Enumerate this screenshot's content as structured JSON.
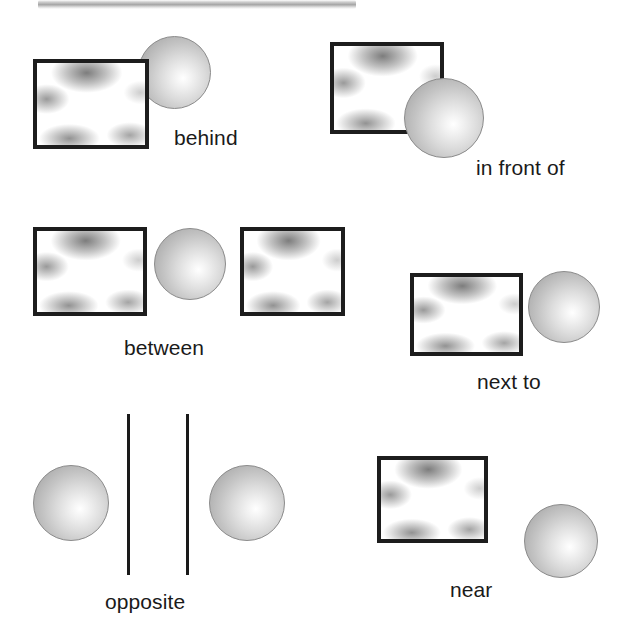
{
  "figure": {
    "background_color": "#ffffff",
    "width": 630,
    "height": 625,
    "shape_colors": {
      "rect_border": "#1d1d1d",
      "rect_fill": "#ffffff",
      "sphere_fill": "#c9c9c9",
      "sphere_border": "#8c8c8c",
      "line": "#1a1a1a",
      "label_text": "#1a1a1a",
      "scan_bar": "#969696"
    }
  },
  "items": [
    {
      "id": "behind",
      "label": "behind",
      "label_x": 174,
      "label_y": 127,
      "shapes": [
        {
          "kind": "sphere",
          "name": "sphere",
          "x": 138,
          "y": 36,
          "w": 73,
          "h": 73,
          "z": 1
        },
        {
          "kind": "rect",
          "name": "rectangle",
          "x": 33,
          "y": 59,
          "w": 116,
          "h": 90,
          "z": 2
        }
      ]
    },
    {
      "id": "in-front-of",
      "label": "in front of",
      "label_x": 476,
      "label_y": 157,
      "shapes": [
        {
          "kind": "rect",
          "name": "rectangle",
          "x": 330,
          "y": 42,
          "w": 114,
          "h": 92,
          "z": 1
        },
        {
          "kind": "sphere",
          "name": "sphere",
          "x": 404,
          "y": 78,
          "w": 80,
          "h": 80,
          "z": 2
        }
      ]
    },
    {
      "id": "between",
      "label": "between",
      "label_x": 124,
      "label_y": 337,
      "shapes": [
        {
          "kind": "rect",
          "name": "rectangle-left",
          "x": 33,
          "y": 227,
          "w": 114,
          "h": 89,
          "z": 1
        },
        {
          "kind": "sphere",
          "name": "sphere",
          "x": 154,
          "y": 228,
          "w": 72,
          "h": 72,
          "z": 1
        },
        {
          "kind": "rect",
          "name": "rectangle-right",
          "x": 240,
          "y": 227,
          "w": 105,
          "h": 89,
          "z": 1
        }
      ]
    },
    {
      "id": "next-to",
      "label": "next to",
      "label_x": 477,
      "label_y": 371,
      "shapes": [
        {
          "kind": "rect",
          "name": "rectangle",
          "x": 410,
          "y": 273,
          "w": 113,
          "h": 83,
          "z": 1
        },
        {
          "kind": "sphere",
          "name": "sphere",
          "x": 528,
          "y": 271,
          "w": 72,
          "h": 72,
          "z": 1
        }
      ]
    },
    {
      "id": "opposite",
      "label": "opposite",
      "label_x": 105,
      "label_y": 591,
      "shapes": [
        {
          "kind": "sphere",
          "name": "sphere-left",
          "x": 33,
          "y": 465,
          "w": 76,
          "h": 76,
          "z": 1
        },
        {
          "kind": "line",
          "name": "divider-line-left",
          "x": 127,
          "y": 414,
          "w": 3,
          "h": 161,
          "z": 1
        },
        {
          "kind": "line",
          "name": "divider-line-right",
          "x": 186,
          "y": 414,
          "w": 3,
          "h": 161,
          "z": 1
        },
        {
          "kind": "sphere",
          "name": "sphere-right",
          "x": 209,
          "y": 465,
          "w": 76,
          "h": 76,
          "z": 1
        }
      ]
    },
    {
      "id": "near",
      "label": "near",
      "label_x": 450,
      "label_y": 579,
      "shapes": [
        {
          "kind": "rect",
          "name": "rectangle",
          "x": 377,
          "y": 456,
          "w": 111,
          "h": 87,
          "z": 1
        },
        {
          "kind": "sphere",
          "name": "sphere",
          "x": 524,
          "y": 504,
          "w": 74,
          "h": 74,
          "z": 1
        }
      ]
    }
  ],
  "artifacts": [
    {
      "name": "scan-edge-bar",
      "x": 38,
      "y": 0,
      "w": 318,
      "h": 9
    }
  ]
}
